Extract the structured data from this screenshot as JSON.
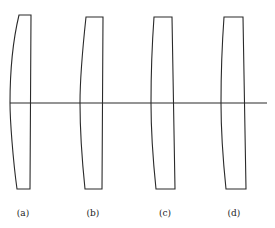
{
  "figure": {
    "axis": {
      "x1": 10,
      "x2": 267,
      "y": 103
    },
    "panels": [
      {
        "label": "(a)",
        "label_pos": {
          "x": 23,
          "y": 208
        },
        "path": "M19,15 L31,15 L30,189 L17,189 C13,160 10,120 10,103 C10,75 13,40 19,15 Z"
      },
      {
        "label": "(b)",
        "label_pos": {
          "x": 93,
          "y": 208
        },
        "path": "M86,17 L103,17 L102,189 L85,189 C82,160 80,125 80,103 C80,75 83,45 86,17 Z"
      },
      {
        "label": "(c)",
        "label_pos": {
          "x": 165,
          "y": 208
        },
        "path": "M154,17 L172,17 L175,189 L156,189 C153,160 151,130 151,103 C151,75 152,45 154,17 Z"
      },
      {
        "label": "(d)",
        "label_pos": {
          "x": 234,
          "y": 208
        },
        "path": "M224,17 L243,17 L246,189 L226,189 C223,160 221,130 221,103 C221,75 222,45 224,17 Z"
      }
    ]
  }
}
